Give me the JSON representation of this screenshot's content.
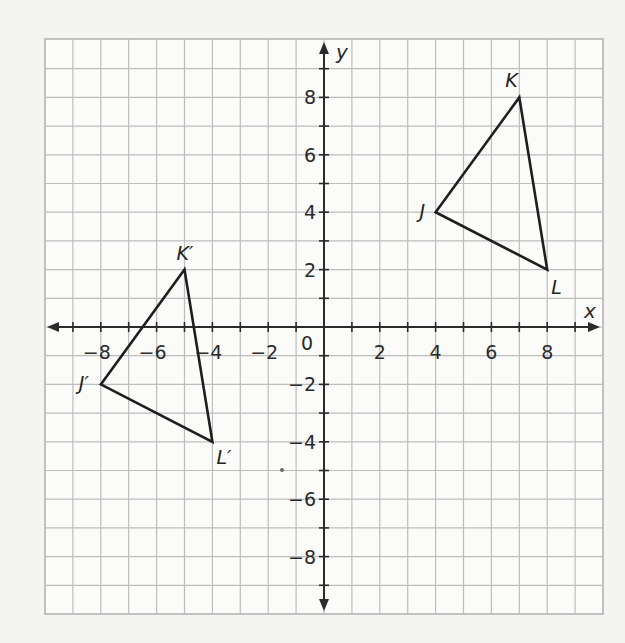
{
  "figure": {
    "type": "coordinate-plane",
    "background_color": "#f4f4f2",
    "grid_color": "#bdbdbd",
    "axis_color": "#2b2b2b",
    "x_axis": {
      "label": "x",
      "min": -10,
      "max": 10,
      "tick_labels": [
        "−8",
        "−6",
        "−4",
        "−2",
        "2",
        "4",
        "6",
        "8"
      ],
      "tick_values": [
        -8,
        -6,
        -4,
        -2,
        2,
        4,
        6,
        8
      ]
    },
    "y_axis": {
      "label": "y",
      "min": -10,
      "max": 10,
      "tick_labels": [
        "8",
        "6",
        "4",
        "2",
        "−2",
        "−4",
        "−6",
        "−8"
      ],
      "tick_values": [
        8,
        6,
        4,
        2,
        -2,
        -4,
        -6,
        -8
      ]
    },
    "origin_label": "0",
    "triangles": [
      {
        "name": "JKL",
        "vertices": [
          {
            "label": "J",
            "x": 4,
            "y": 4
          },
          {
            "label": "K",
            "x": 7,
            "y": 8
          },
          {
            "label": "L",
            "x": 8,
            "y": 2
          }
        ]
      },
      {
        "name": "J'K'L'",
        "vertices": [
          {
            "label": "J′",
            "x": -8,
            "y": -2
          },
          {
            "label": "K′",
            "x": -5,
            "y": 2
          },
          {
            "label": "L′",
            "x": -4,
            "y": -4
          }
        ]
      }
    ]
  },
  "chart_data": {
    "type": "scatter",
    "title": "",
    "xlabel": "x",
    "ylabel": "y",
    "xlim": [
      -10,
      10
    ],
    "ylim": [
      -10,
      10
    ],
    "grid": true,
    "series": [
      {
        "name": "Triangle JKL",
        "points": [
          {
            "label": "J",
            "x": 4,
            "y": 4
          },
          {
            "label": "K",
            "x": 7,
            "y": 8
          },
          {
            "label": "L",
            "x": 8,
            "y": 2
          }
        ],
        "closed": true
      },
      {
        "name": "Triangle J′K′L′",
        "points": [
          {
            "label": "J′",
            "x": -8,
            "y": -2
          },
          {
            "label": "K′",
            "x": -5,
            "y": 2
          },
          {
            "label": "L′",
            "x": -4,
            "y": -4
          }
        ],
        "closed": true
      }
    ],
    "x_tick_labels": [
      "−8",
      "−6",
      "−4",
      "−2",
      "0",
      "2",
      "4",
      "6",
      "8"
    ],
    "y_tick_labels": [
      "−8",
      "−6",
      "−4",
      "−2",
      "2",
      "4",
      "6",
      "8"
    ]
  }
}
